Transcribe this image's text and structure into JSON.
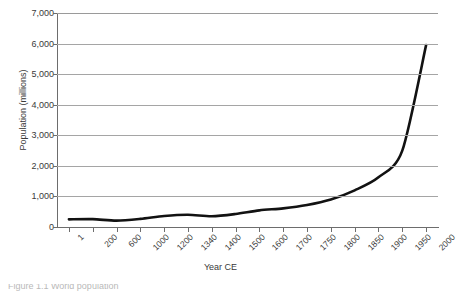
{
  "chart_data": {
    "type": "line",
    "title": "",
    "subtitle": "",
    "xlabel": "Year CE",
    "ylabel": "Population (millions)",
    "categories": [
      "1",
      "200",
      "600",
      "1000",
      "1200",
      "1340",
      "1400",
      "1500",
      "1600",
      "1700",
      "1750",
      "1800",
      "1850",
      "1900",
      "1950",
      "2000"
    ],
    "values": [
      250,
      257,
      208,
      265,
      360,
      400,
      350,
      425,
      545,
      610,
      720,
      900,
      1200,
      1625,
      2500,
      5950
    ],
    "series": [
      {
        "name": "World population",
        "values": [
          250,
          257,
          208,
          265,
          360,
          400,
          350,
          425,
          545,
          610,
          720,
          900,
          1200,
          1625,
          2500,
          5950
        ]
      }
    ],
    "ylim": [
      0,
      7000
    ],
    "yticks": [
      0,
      1000,
      2000,
      3000,
      4000,
      5000,
      6000,
      7000
    ],
    "ytick_labels": [
      "0",
      "1,000",
      "2,000",
      "3,000",
      "4,000",
      "5,000",
      "6,000",
      "7,000"
    ],
    "grid": true,
    "grid_axis": "y",
    "legend": false,
    "legend_position": "none",
    "line_color": "#121212",
    "grid_color": "#a5a5a5",
    "axis_color": "#6d6d6d",
    "background_color": "#ffffff"
  },
  "axes": {
    "y_title": "Population (millions)",
    "x_title": "Year CE"
  },
  "caption": {
    "clipped_text": "Figure 1.1  World population"
  }
}
